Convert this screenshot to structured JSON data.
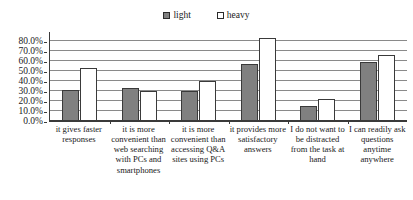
{
  "chart_data": {
    "type": "bar",
    "title": "",
    "subtitle": "",
    "xlabel": "",
    "ylabel": "",
    "ylim": [
      0,
      0.9
    ],
    "grid": true,
    "legend_position": "top-center",
    "categories": [
      "it gives faster responses",
      "it is more convenient than web searching with PCs and smartphones",
      "it is more convenient than accessing Q&A sites using PCs",
      "it provides more satisfactory answers",
      "I do not want to be distracted from the task at hand",
      "I can readily ask questions anytime anywhere"
    ],
    "ytick_labels": [
      "0.0%",
      "10.0%",
      "20.0%",
      "30.0%",
      "40.0%",
      "50.0%",
      "60.0%",
      "70.0%",
      "80.0%"
    ],
    "ytick_values": [
      0,
      10,
      20,
      30,
      40,
      50,
      60,
      70,
      80
    ],
    "series": [
      {
        "name": "light",
        "color": "#808080",
        "values": [
          31.5,
          33.0,
          30.0,
          57.5,
          15.0,
          59.0
        ]
      },
      {
        "name": "heavy",
        "color": "#ffffff",
        "values": [
          53.0,
          30.0,
          40.0,
          83.5,
          22.5,
          66.5
        ]
      }
    ]
  },
  "legend": {
    "items": [
      {
        "label": "light",
        "swatch": "filled-square-icon"
      },
      {
        "label": "heavy",
        "swatch": "open-square-icon"
      }
    ]
  }
}
